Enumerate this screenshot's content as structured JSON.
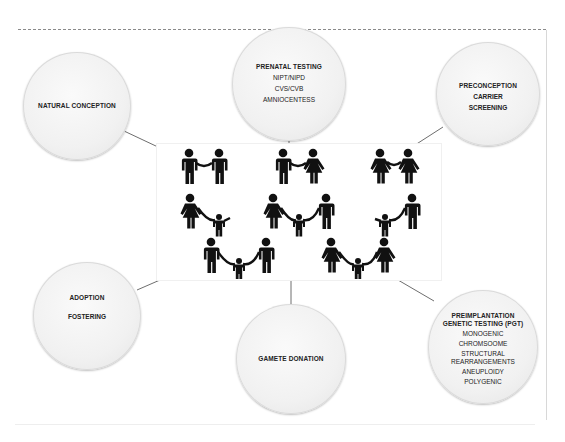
{
  "diagram": {
    "center": {
      "label": "family-configurations",
      "rows": [
        [
          "male-male couple",
          "male-female couple",
          "female-female couple"
        ],
        [
          "single mother with child",
          "heterosexual couple with child",
          "single father with child"
        ],
        [
          "male-male couple with child",
          "female-female couple with child"
        ]
      ]
    },
    "nodes": {
      "natural_conception": {
        "title": "NATURAL CONCEPTION",
        "items": []
      },
      "prenatal_testing": {
        "title": "PRENATAL TESTING",
        "items": [
          "NIPT/NIPD",
          "CVS/CVB",
          "AMNIOCENTESS"
        ]
      },
      "preconception": {
        "title": "PRECONCEPTION",
        "items": [
          "CARRIER",
          "SCREENING"
        ]
      },
      "adoption": {
        "title": "ADOPTION",
        "items": [
          "FOSTERING"
        ]
      },
      "gamete_donation": {
        "title": "GAMETE DONATION",
        "items": []
      },
      "pgt": {
        "title": "PREIMPLANTATION GENETIC TESTING (PGT)",
        "items": [
          "MONOGENIC",
          "CHROMSOOME",
          "STRUCTURAL REARRANGEMENTS",
          "ANEUPLOIDY",
          "POLYGENIC"
        ]
      }
    },
    "colors": {
      "node_fill": "#f1f1f1",
      "connector": "#6e6e6e",
      "icon": "#111111"
    }
  }
}
